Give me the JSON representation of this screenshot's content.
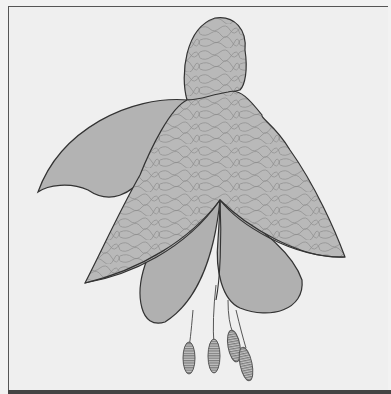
{
  "illustration": {
    "subject": "Fuchsia flower",
    "style": "grayscale line art with marbled texture",
    "colors": {
      "background": "#efefef",
      "frame": "#555555",
      "petal_plain": "#b0b0b0",
      "petal_textured": "#b8b8b8",
      "texture_line": "#8a8a8a",
      "outline": "#333333",
      "anther": "#9a9a9a"
    },
    "parts": {
      "bud": "top bud (textured)",
      "sepals": [
        "left sepal (plain)",
        "center sepal (textured)",
        "right sepal (textured)",
        "lower-left sepal (textured)"
      ],
      "petals": [
        "left petal",
        "right petal"
      ],
      "stamens": 4
    }
  }
}
